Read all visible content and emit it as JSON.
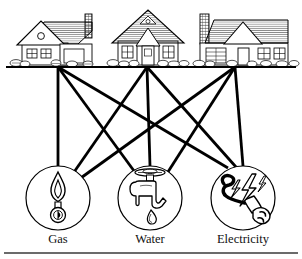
{
  "figure": {
    "kind": "graph-diagram",
    "name": "three-utilities-problem",
    "background_color": "#ffffff",
    "line_color": "#000000",
    "text_color": "#111111"
  },
  "houses": [
    {
      "id": "house-1",
      "name": "house-left",
      "x": 58,
      "y": 66
    },
    {
      "id": "house-2",
      "name": "house-middle",
      "x": 147,
      "y": 66
    },
    {
      "id": "house-3",
      "name": "house-right",
      "x": 235,
      "y": 66
    }
  ],
  "ground_line": {
    "x1": 6,
    "y1": 67,
    "x2": 296,
    "y2": 67
  },
  "utilities": [
    {
      "id": "gas",
      "label": "Gas",
      "icon": "flame-icon",
      "cx": 58,
      "cy": 198,
      "r": 32,
      "label_x": 58,
      "label_y": 243
    },
    {
      "id": "water",
      "label": "Water",
      "icon": "faucet-icon",
      "cx": 150,
      "cy": 198,
      "r": 32,
      "label_x": 150,
      "label_y": 243
    },
    {
      "id": "electricity",
      "label": "Electricity",
      "icon": "plug-icon",
      "cx": 243,
      "cy": 198,
      "r": 32,
      "label_x": 243,
      "label_y": 243
    }
  ],
  "edges": [
    {
      "id": "e-h1-gas",
      "from": "house-1",
      "to": "gas"
    },
    {
      "id": "e-h1-water",
      "from": "house-1",
      "to": "water"
    },
    {
      "id": "e-h1-electricity",
      "from": "house-1",
      "to": "electricity"
    },
    {
      "id": "e-h2-gas",
      "from": "house-2",
      "to": "gas"
    },
    {
      "id": "e-h2-water",
      "from": "house-2",
      "to": "water"
    },
    {
      "id": "e-h2-electricity",
      "from": "house-2",
      "to": "electricity"
    },
    {
      "id": "e-h3-gas",
      "from": "house-3",
      "to": "gas"
    },
    {
      "id": "e-h3-water",
      "from": "house-3",
      "to": "water"
    },
    {
      "id": "e-h3-electricity",
      "from": "house-3",
      "to": "electricity"
    }
  ],
  "bottom_rule": {
    "x1": 4,
    "y1": 253,
    "x2": 298,
    "y2": 253
  }
}
